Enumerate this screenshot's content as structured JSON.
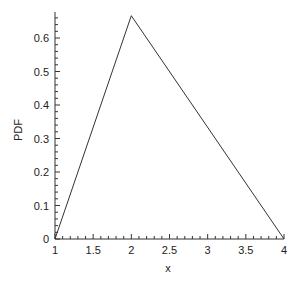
{
  "chart_data": {
    "type": "line",
    "title": "",
    "xlabel": "x",
    "ylabel": "PDF",
    "xlim": [
      1,
      4
    ],
    "ylim": [
      0,
      0.667
    ],
    "grid": false,
    "legend": null,
    "x_ticks": [
      "1",
      "1.5",
      "2",
      "2.5",
      "3",
      "3.5",
      "4"
    ],
    "y_ticks": [
      "0",
      "0.1",
      "0.2",
      "0.3",
      "0.4",
      "0.5",
      "0.6"
    ],
    "series": [
      {
        "name": "triangular pdf",
        "x": [
          1,
          2,
          4
        ],
        "y": [
          0,
          0.6667,
          0
        ]
      }
    ],
    "line_color": "#333333"
  }
}
